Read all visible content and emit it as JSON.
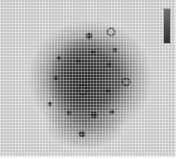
{
  "image": {
    "description": "Grayscale image with fine grid overlay showing a dark diffuse blob with small dark spots",
    "label_text": "",
    "colors": {
      "background": "#c9c9c9",
      "blob": "#303030",
      "grid": "#ffffff"
    }
  },
  "spots": [
    {
      "x": 89,
      "y": 36,
      "r": 3,
      "type": "solid"
    },
    {
      "x": 110,
      "y": 31,
      "r": 3,
      "type": "ring"
    },
    {
      "x": 115,
      "y": 50,
      "r": 2,
      "type": "solid"
    },
    {
      "x": 93,
      "y": 52,
      "r": 2,
      "type": "solid"
    },
    {
      "x": 78,
      "y": 61,
      "r": 2,
      "type": "solid"
    },
    {
      "x": 59,
      "y": 58,
      "r": 2,
      "type": "solid"
    },
    {
      "x": 109,
      "y": 65,
      "r": 2,
      "type": "solid"
    },
    {
      "x": 56,
      "y": 78,
      "r": 2,
      "type": "solid"
    },
    {
      "x": 125,
      "y": 81,
      "r": 3,
      "type": "ring"
    },
    {
      "x": 82,
      "y": 89,
      "r": 4,
      "type": "ring"
    },
    {
      "x": 108,
      "y": 91,
      "r": 2,
      "type": "solid"
    },
    {
      "x": 50,
      "y": 104,
      "r": 2,
      "type": "solid"
    },
    {
      "x": 69,
      "y": 113,
      "r": 2,
      "type": "solid"
    },
    {
      "x": 94,
      "y": 115,
      "r": 3,
      "type": "solid"
    },
    {
      "x": 112,
      "y": 112,
      "r": 2,
      "type": "solid"
    },
    {
      "x": 82,
      "y": 134,
      "r": 3,
      "type": "solid"
    }
  ]
}
